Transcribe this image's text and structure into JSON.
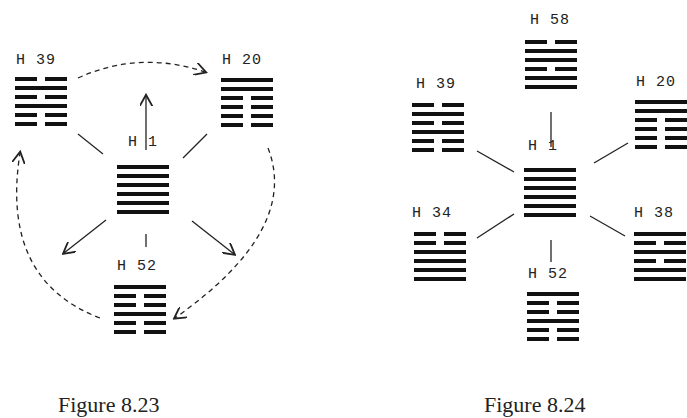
{
  "figures": [
    {
      "caption": "Figure 8.23",
      "center": {
        "label": "H 1",
        "lines": [
          "solid",
          "solid",
          "solid",
          "solid",
          "solid",
          "solid"
        ]
      },
      "nodes": [
        {
          "id": "h39",
          "label": "H 39",
          "lines": [
            "broken",
            "solid",
            "broken",
            "solid",
            "broken",
            "broken"
          ]
        },
        {
          "id": "h20",
          "label": "H 20",
          "lines": [
            "solid",
            "solid",
            "broken",
            "broken",
            "broken",
            "broken"
          ]
        },
        {
          "id": "h52",
          "label": "H 52",
          "lines": [
            "solid",
            "broken",
            "broken",
            "solid",
            "broken",
            "broken"
          ]
        }
      ],
      "connectors": "dashed cycle H39 → H20 → H52 → H39; solid arrows from H1 up, down-left, down-right"
    },
    {
      "caption": "Figure 8.24",
      "center": {
        "label": "H 1",
        "lines": [
          "solid",
          "solid",
          "solid",
          "solid",
          "solid",
          "solid"
        ]
      },
      "nodes": [
        {
          "id": "h58",
          "label": "H 58",
          "lines": [
            "broken",
            "solid",
            "solid",
            "broken",
            "solid",
            "solid"
          ]
        },
        {
          "id": "h39",
          "label": "H 39",
          "lines": [
            "broken",
            "solid",
            "broken",
            "solid",
            "broken",
            "broken"
          ]
        },
        {
          "id": "h20",
          "label": "H 20",
          "lines": [
            "solid",
            "solid",
            "broken",
            "broken",
            "broken",
            "broken"
          ]
        },
        {
          "id": "h34",
          "label": "H 34",
          "lines": [
            "broken",
            "broken",
            "solid",
            "solid",
            "solid",
            "solid"
          ]
        },
        {
          "id": "h38",
          "label": "H 38",
          "lines": [
            "solid",
            "broken",
            "solid",
            "broken",
            "solid",
            "solid"
          ]
        },
        {
          "id": "h52",
          "label": "H 52",
          "lines": [
            "solid",
            "broken",
            "broken",
            "solid",
            "broken",
            "broken"
          ]
        }
      ]
    }
  ]
}
